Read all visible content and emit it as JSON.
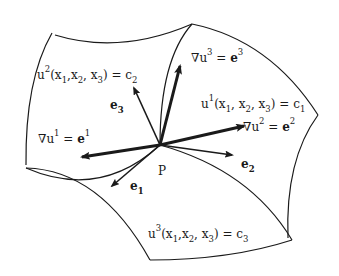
{
  "diagram": {
    "type": "curvilinear coordinate surfaces",
    "point_label": "P",
    "surfaces": [
      {
        "id": "u2",
        "label_base": "u",
        "label_sup": "2",
        "label_args": "(x",
        "args": [
          "1",
          "2",
          "3"
        ],
        "rhs": "c",
        "rhs_sub": "2"
      },
      {
        "id": "u1",
        "label_base": "u",
        "label_sup": "1",
        "rhs": "c",
        "rhs_sub": "1"
      },
      {
        "id": "u3",
        "label_base": "u",
        "label_sup": "3",
        "rhs": "c",
        "rhs_sub": "3"
      }
    ],
    "gradients": [
      {
        "id": "grad-u1",
        "lhs": "∇u",
        "sup": "1",
        "eq": " = ",
        "rhs": "e",
        "rhs_sup": "1"
      },
      {
        "id": "grad-u2",
        "lhs": "∇u",
        "sup": "2",
        "eq": " = ",
        "rhs": "e",
        "rhs_sup": "2"
      },
      {
        "id": "grad-u3",
        "lhs": "∇u",
        "sup": "3",
        "eq": " = ",
        "rhs": "e",
        "rhs_sup": "3"
      }
    ],
    "basis_vectors": [
      {
        "id": "e1",
        "base": "e",
        "sub": "1"
      },
      {
        "id": "e2",
        "base": "e",
        "sub": "2"
      },
      {
        "id": "e3",
        "base": "e",
        "sub": "3"
      }
    ],
    "text": {
      "u": "u",
      "x": "x",
      "comma": ",",
      "open": "(",
      "close": ")",
      "equals": " = ",
      "c": "c",
      "nabla_u": "∇u",
      "e": "e"
    },
    "colors": {
      "stroke": "#1a1a1a",
      "background": "#ffffff"
    }
  }
}
